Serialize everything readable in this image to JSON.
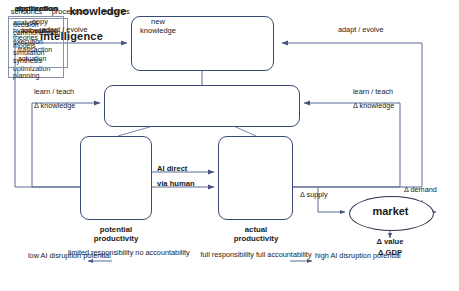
{
  "diagram": {
    "colors": {
      "node_stroke": "#3b4a72",
      "wire": "#5a6b94",
      "inner_box_stroke": "#8a93ab",
      "text": "#1a1a1a",
      "background": "#ffffff"
    },
    "nodes": {
      "intelligence": {
        "title": "intelligence",
        "parts": [
          "sensorics",
          "processors",
          "motorics"
        ]
      },
      "knowledge": {
        "title": "knowledge",
        "left_label_line1": "copy",
        "left_label_line2": "knowledge",
        "right_label_line1": "new",
        "right_label_line2": "knowledge"
      },
      "abstraction": {
        "title": "abstraction",
        "items": [
          "analysis",
          "hypothesis",
          "theories",
          "models",
          "simulation",
          "synthesis",
          "optimization",
          "planning"
        ]
      },
      "application": {
        "title": "application",
        "items": [
          "decision",
          "communication",
          "execution"
        ],
        "indented_items": [
          "transaction",
          "actuation"
        ]
      },
      "market": {
        "title": "market"
      }
    },
    "edge_labels": {
      "adapt_evolve_left": "adapt / evolve",
      "adapt_evolve_right": "adapt / evolve",
      "learn_teach_left": "learn / teach",
      "delta_knowledge_left": "Δ knowledge",
      "learn_teach_right": "learn / teach",
      "delta_knowledge_right": "Δ knowledge",
      "ai_direct": "AI direct",
      "via_human": "via human",
      "delta_supply": "Δ supply",
      "delta_demand": "Δ demand"
    },
    "annotations": {
      "delta_value": "Δ value",
      "delta_gdp": "Δ GDP",
      "potential_productivity_line1": "potential",
      "potential_productivity_line2": "productivity",
      "potential_sub": "limited responsibility no accountability",
      "actual_productivity_line1": "actual",
      "actual_productivity_line2": "productivity",
      "actual_sub": "full responsibility full accountability",
      "low_ai_disruption": "low AI disruption potential",
      "high_ai_disruption": "high AI disruption potential"
    }
  }
}
